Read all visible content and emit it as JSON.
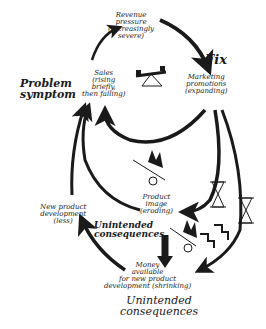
{
  "nodes": {
    "revenue": {
      "lines": [
        "Revenue",
        "pressure",
        "(increasingly",
        "severe)"
      ]
    },
    "sales": {
      "lines": [
        "Sales",
        "(rising",
        "briefly,",
        "then falling)"
      ]
    },
    "marketing": {
      "lines": [
        "Marketing",
        "promotions",
        "(expanding)"
      ]
    },
    "product_image": {
      "lines": [
        "Product",
        "image",
        "(eroding)"
      ]
    },
    "new_product": {
      "lines": [
        "New product",
        "development",
        "(less)"
      ]
    },
    "money": {
      "lines": [
        "Money",
        "available",
        "for new product",
        "development (shrinking)"
      ]
    }
  },
  "annotations": {
    "fix": "Fix",
    "problem_symptom": [
      "Problem",
      "symptom"
    ],
    "unintended_left": [
      "Unintended",
      "consequences"
    ],
    "unintended_bottom": [
      "Unintended",
      "consequences"
    ]
  },
  "icons": [
    "seesaw-icon",
    "snowball-hill-icon",
    "hourglass-icon",
    "stair-step-delay-icon"
  ]
}
